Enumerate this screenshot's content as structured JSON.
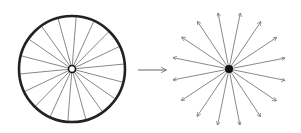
{
  "diagram": {
    "wheel": {
      "cx": 72,
      "cy": 69,
      "r": 53,
      "spokes": 18,
      "hub_r": 3.5,
      "rim_color": "#222222",
      "spoke_color": "#555555"
    },
    "transition_arrow": {
      "x1": 138,
      "y1": 70,
      "x2": 166,
      "y2": 70,
      "color": "#555555"
    },
    "star": {
      "cx": 229,
      "cy": 69,
      "r": 57,
      "arrows": 16,
      "dot_r": 4,
      "color": "#555555",
      "dot_color": "#111111"
    }
  }
}
